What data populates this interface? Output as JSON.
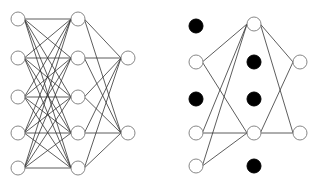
{
  "diagram": {
    "title": "",
    "type": "neural-network-dropout-comparison",
    "colors": {
      "background": "#ffffff",
      "node_stroke": "#888888",
      "node_fill": "#ffffff",
      "dropped_fill": "#000000",
      "edge": "#333333"
    },
    "node_radius": 7,
    "networks": [
      {
        "name": "standard-network",
        "layers": [
          {
            "x": 18,
            "nodes": [
              {
                "y": 19
              },
              {
                "y": 58
              },
              {
                "y": 97
              },
              {
                "y": 133
              },
              {
                "y": 168
              }
            ]
          },
          {
            "x": 78,
            "nodes": [
              {
                "y": 19
              },
              {
                "y": 58
              },
              {
                "y": 97
              },
              {
                "y": 133
              },
              {
                "y": 168
              }
            ]
          },
          {
            "x": 128,
            "nodes": [
              {
                "y": 58
              },
              {
                "y": 133
              }
            ]
          }
        ],
        "edges": "fully-connected"
      },
      {
        "name": "dropout-network",
        "layers": [
          {
            "x": 196,
            "nodes": [
              {
                "y": 26,
                "dropped": true
              },
              {
                "y": 62
              },
              {
                "y": 99,
                "dropped": true
              },
              {
                "y": 133
              },
              {
                "y": 166
              }
            ]
          },
          {
            "x": 254,
            "nodes": [
              {
                "y": 24
              },
              {
                "y": 62,
                "dropped": true
              },
              {
                "y": 99,
                "dropped": true
              },
              {
                "y": 133
              },
              {
                "y": 166,
                "dropped": true
              }
            ]
          },
          {
            "x": 300,
            "nodes": [
              {
                "y": 62
              },
              {
                "y": 133
              }
            ]
          }
        ],
        "edges": "connected-between-active-nodes"
      }
    ]
  }
}
